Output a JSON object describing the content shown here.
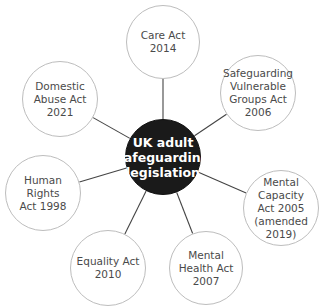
{
  "diagram": {
    "title": "UK adult safeguarding legislation",
    "colors": {
      "center_fill": "#1a1a1a",
      "center_text": "#ffffff",
      "node_fill": "#ffffff",
      "node_border": "#bdbdbd",
      "node_text": "#4a4a4a",
      "connector": "#444444"
    },
    "center": {
      "label": "UK adult\nsafeguarding\nlegislation",
      "cx": 163,
      "cy": 157,
      "r": 38
    },
    "nodes": [
      {
        "id": "care-act",
        "label": "Care Act\n2014",
        "cx": 163,
        "cy": 42,
        "r": 37
      },
      {
        "id": "safeguarding-vulnerable-groups-act",
        "label": "Safeguarding\nVulnerable\nGroups Act\n2006",
        "cx": 258,
        "cy": 93,
        "r": 38
      },
      {
        "id": "mental-capacity-act",
        "label": "Mental\nCapacity\nAct 2005\n(amended\n2019)",
        "cx": 281,
        "cy": 208,
        "r": 38
      },
      {
        "id": "mental-health-act",
        "label": "Mental\nHealth Act\n2007",
        "cx": 206,
        "cy": 268,
        "r": 37
      },
      {
        "id": "equality-act",
        "label": "Equality Act\n2010",
        "cx": 108,
        "cy": 268,
        "r": 38
      },
      {
        "id": "human-rights-act",
        "label": "Human Rights\nAct 1998",
        "cx": 43,
        "cy": 193,
        "r": 38
      },
      {
        "id": "domestic-abuse-act",
        "label": "Domestic\nAbuse Act\n2021",
        "cx": 60,
        "cy": 99,
        "r": 38
      }
    ]
  }
}
